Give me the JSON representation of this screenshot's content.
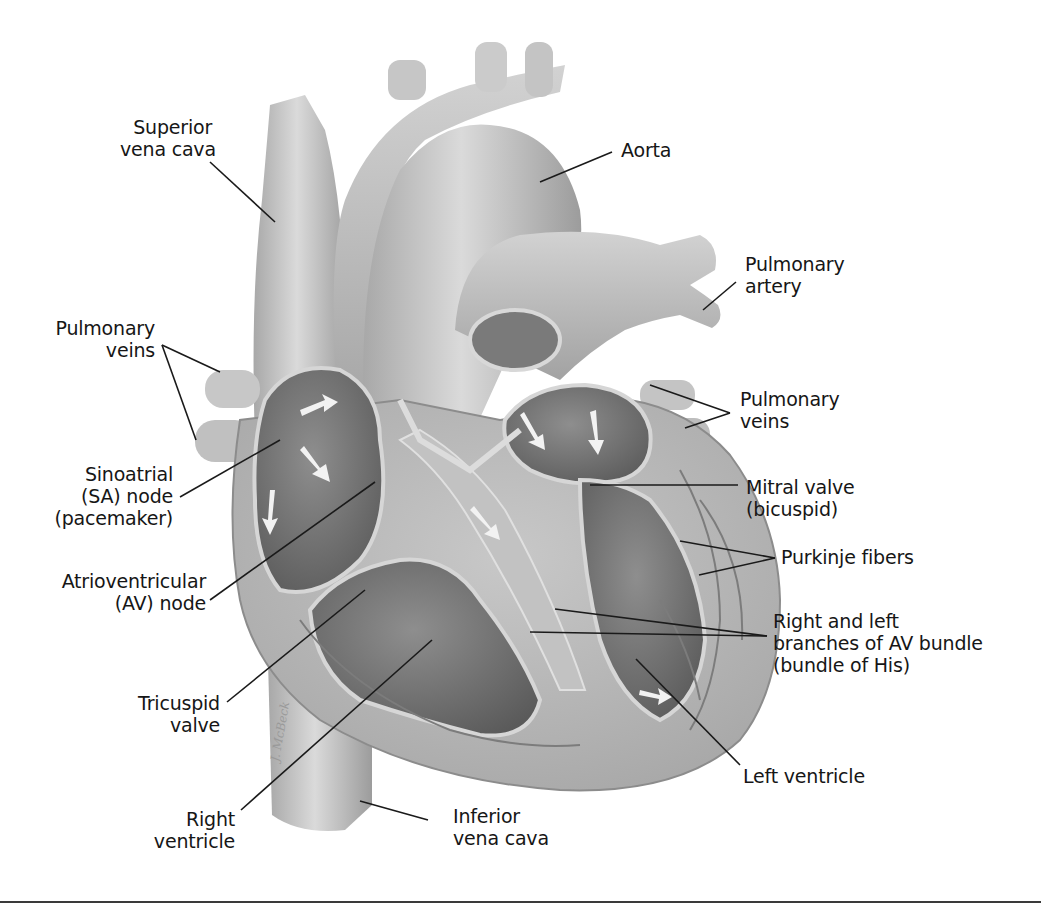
{
  "diagram": {
    "style": "grayscale anatomical cutaway illustration",
    "colors": {
      "background": "#ffffff",
      "vessel_light": "#c9c9c9",
      "vessel_mid": "#a9a9a9",
      "chamber_dark": "#6e6e6e",
      "wall": "#b8b8b8",
      "text": "#161616",
      "leader": "#1a1a1a"
    },
    "signature": "J. McBeck",
    "labels": {
      "superior_vena_cava": [
        "Superior",
        "vena cava"
      ],
      "aorta": [
        "Aorta"
      ],
      "pulmonary_artery": [
        "Pulmonary",
        "artery"
      ],
      "pulmonary_veins_left": [
        "Pulmonary",
        "veins"
      ],
      "pulmonary_veins_right": [
        "Pulmonary",
        "veins"
      ],
      "sa_node": [
        "Sinoatrial",
        "(SA) node",
        "(pacemaker)"
      ],
      "mitral_valve": [
        "Mitral valve",
        "(bicuspid)"
      ],
      "av_node": [
        "Atrioventricular",
        "(AV) node"
      ],
      "purkinje_fibers": [
        "Purkinje fibers"
      ],
      "av_bundle": [
        "Right and left",
        "branches of AV bundle",
        "(bundle of His)"
      ],
      "tricuspid_valve": [
        "Tricuspid",
        "valve"
      ],
      "right_ventricle": [
        "Right",
        "ventricle"
      ],
      "inferior_vena_cava": [
        "Inferior",
        "vena cava"
      ],
      "left_ventricle": [
        "Left ventricle"
      ]
    }
  }
}
